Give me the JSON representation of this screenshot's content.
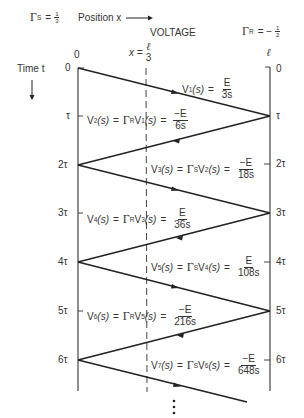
{
  "header": {
    "gamma_s_symbol": "Γ",
    "gamma_s_sub": "S",
    "gamma_s_eq": "=",
    "gamma_s_num": "1",
    "gamma_s_den": "3",
    "position_label": "Position x",
    "title": "VOLTAGE",
    "gamma_r_symbol": "Γ",
    "gamma_r_sub": "R",
    "gamma_r_eq": "= −",
    "gamma_r_num": "1",
    "gamma_r_den": "2"
  },
  "axes": {
    "left_pos_label": "0",
    "right_pos_label": "ℓ",
    "marker_prefix": "x =",
    "marker_num": "ℓ",
    "marker_den": "3",
    "time_label": "Time t",
    "left_ticks": [
      "0",
      "τ",
      "2τ",
      "3τ",
      "4τ",
      "5τ",
      "6τ"
    ],
    "right_ticks": [
      "0",
      "τ",
      "2τ",
      "3τ",
      "4τ",
      "5τ",
      "6τ"
    ]
  },
  "waves": [
    {
      "lhs": "V",
      "idx": "1",
      "rhs_expr": "",
      "num": "E",
      "den": "3s"
    },
    {
      "lhs": "V",
      "idx": "2",
      "rhs_expr": "Γ",
      "rhs_sub": "R",
      "rhs_v": "V",
      "rhs_idx": "1",
      "num": "−E",
      "den": "6s"
    },
    {
      "lhs": "V",
      "idx": "3",
      "rhs_expr": "Γ",
      "rhs_sub": "S",
      "rhs_v": "V",
      "rhs_idx": "2",
      "num": "−E",
      "den": "18s"
    },
    {
      "lhs": "V",
      "idx": "4",
      "rhs_expr": "Γ",
      "rhs_sub": "R",
      "rhs_v": "V",
      "rhs_idx": "3",
      "num": "E",
      "den": "36s"
    },
    {
      "lhs": "V",
      "idx": "5",
      "rhs_expr": "Γ",
      "rhs_sub": "S",
      "rhs_v": "V",
      "rhs_idx": "4",
      "num": "E",
      "den": "108s"
    },
    {
      "lhs": "V",
      "idx": "6",
      "rhs_expr": "Γ",
      "rhs_sub": "R",
      "rhs_v": "V",
      "rhs_idx": "5",
      "num": "−E",
      "den": "216s"
    },
    {
      "lhs": "V",
      "idx": "7",
      "rhs_expr": "Γ",
      "rhs_sub": "S",
      "rhs_v": "V",
      "rhs_idx": "6",
      "num": "−E",
      "den": "648s"
    }
  ],
  "s_var": "(s)",
  "equals": "=",
  "colors": {
    "line": "#222222",
    "text": "#333333",
    "background": "#ffffff"
  }
}
